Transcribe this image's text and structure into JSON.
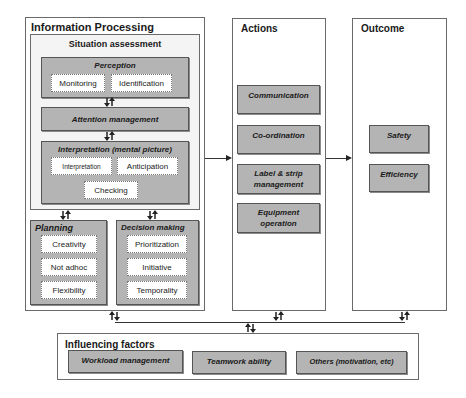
{
  "information_processing": {
    "title": "Information Processing",
    "situation_assessment": {
      "title": "Situation assessment",
      "perception": {
        "title": "Perception",
        "items": [
          "Monitoring",
          "Identification"
        ]
      },
      "attention": {
        "title": "Attention management"
      },
      "interpretation": {
        "title": "Interpretation (mental picture)",
        "items": [
          "Interpretation",
          "Anticipation",
          "Checking"
        ]
      }
    },
    "planning": {
      "title": "Planning",
      "items": [
        "Creativity",
        "Not adhoc",
        "Flexibility"
      ]
    },
    "decision_making": {
      "title": "Decision making",
      "items": [
        "Prioritization",
        "Initiative",
        "Temporality"
      ]
    }
  },
  "actions": {
    "title": "Actions",
    "items": [
      "Communication",
      "Co-ordination",
      "Label & strip management",
      "Equipment operation"
    ]
  },
  "outcome": {
    "title": "Outcome",
    "items": [
      "Safety",
      "Efficiency"
    ]
  },
  "influencing_factors": {
    "title": "Influencing factors",
    "items": [
      "Workload management",
      "Teamwork ability",
      "Others (motivation, etc)"
    ]
  },
  "connector_icons": {
    "bidirectional": "bidirectional-arrow-icon",
    "forward": "right-arrow-icon"
  },
  "colors": {
    "panel_border": "#6a6a6a",
    "grey_box": "#b4b4b4",
    "inner_bg": "#f4f4f4",
    "line": "#333333"
  }
}
